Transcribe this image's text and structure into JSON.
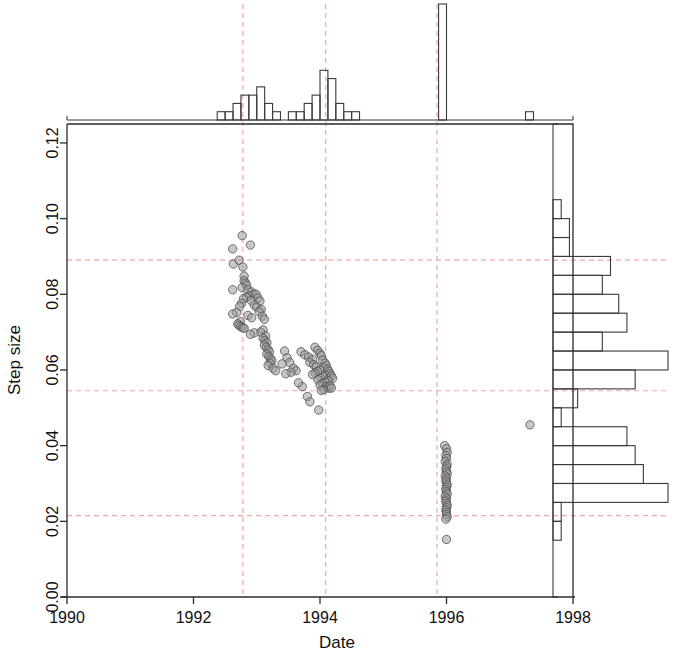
{
  "chart_data": {
    "type": "scatter",
    "title": "",
    "subtitle": "",
    "xlabel": "Date",
    "ylabel": "Step size",
    "xlim": [
      1990,
      1998
    ],
    "ylim": [
      0.0,
      0.125
    ],
    "xticks": [
      1990,
      1992,
      1994,
      1996,
      1998
    ],
    "xticklabels": [
      "1990",
      "1992",
      "1994",
      "1996",
      "1998"
    ],
    "yticks": [
      0.0,
      0.02,
      0.04,
      0.06,
      0.08,
      0.1,
      0.12
    ],
    "yticklabels": [
      "0.00",
      "0.02",
      "0.04",
      "0.06",
      "0.08",
      "0.10",
      "0.12"
    ],
    "grid": false,
    "legend": null,
    "marker": {
      "shape": "circle",
      "fill_color": "#9b9b9b",
      "fill_opacity": 0.55,
      "edge_color": "#4a4a4a",
      "radius_px": 4.2
    },
    "reference_lines": {
      "color": "#f0a0a0",
      "style": "dashed",
      "horizontal": [
        0.089,
        0.0545,
        0.0215
      ],
      "vertical": [
        1992.78,
        1994.09,
        1995.85
      ]
    },
    "points": [
      [
        1992.62,
        0.092
      ],
      [
        1992.63,
        0.088
      ],
      [
        1992.77,
        0.0955
      ],
      [
        1992.9,
        0.093
      ],
      [
        1992.72,
        0.089
      ],
      [
        1992.78,
        0.0872
      ],
      [
        1992.62,
        0.0812
      ],
      [
        1992.8,
        0.0848
      ],
      [
        1992.8,
        0.0836
      ],
      [
        1992.82,
        0.083
      ],
      [
        1992.84,
        0.0824
      ],
      [
        1992.77,
        0.0818
      ],
      [
        1992.86,
        0.0812
      ],
      [
        1992.92,
        0.0806
      ],
      [
        1992.95,
        0.08
      ],
      [
        1992.88,
        0.0796
      ],
      [
        1992.84,
        0.0792
      ],
      [
        1992.79,
        0.0788
      ],
      [
        1992.91,
        0.0784
      ],
      [
        1992.99,
        0.08
      ],
      [
        1993.02,
        0.079
      ],
      [
        1993.05,
        0.0782
      ],
      [
        1992.76,
        0.0776
      ],
      [
        1992.73,
        0.0768
      ],
      [
        1992.96,
        0.0772
      ],
      [
        1993.0,
        0.0766
      ],
      [
        1993.07,
        0.076
      ],
      [
        1993.04,
        0.0754
      ],
      [
        1992.68,
        0.0752
      ],
      [
        1992.62,
        0.0748
      ],
      [
        1992.86,
        0.0744
      ],
      [
        1992.92,
        0.0738
      ],
      [
        1993.09,
        0.0742
      ],
      [
        1993.12,
        0.0734
      ],
      [
        1992.74,
        0.0728
      ],
      [
        1992.7,
        0.0722
      ],
      [
        1992.72,
        0.0718
      ],
      [
        1992.75,
        0.0714
      ],
      [
        1992.78,
        0.0712
      ],
      [
        1992.8,
        0.071
      ],
      [
        1993.1,
        0.0706
      ],
      [
        1993.06,
        0.07
      ],
      [
        1992.96,
        0.0698
      ],
      [
        1992.9,
        0.0694
      ],
      [
        1993.14,
        0.069
      ],
      [
        1993.1,
        0.0684
      ],
      [
        1993.13,
        0.0678
      ],
      [
        1993.16,
        0.0672
      ],
      [
        1993.12,
        0.0666
      ],
      [
        1993.15,
        0.066
      ],
      [
        1993.18,
        0.0654
      ],
      [
        1993.2,
        0.0648
      ],
      [
        1993.16,
        0.0642
      ],
      [
        1993.19,
        0.0636
      ],
      [
        1993.22,
        0.063
      ],
      [
        1993.24,
        0.0624
      ],
      [
        1993.21,
        0.0618
      ],
      [
        1993.18,
        0.0612
      ],
      [
        1993.26,
        0.0604
      ],
      [
        1993.3,
        0.0598
      ],
      [
        1993.44,
        0.065
      ],
      [
        1993.48,
        0.0632
      ],
      [
        1993.52,
        0.062
      ],
      [
        1993.4,
        0.0616
      ],
      [
        1993.58,
        0.0604
      ],
      [
        1993.62,
        0.0598
      ],
      [
        1993.54,
        0.0594
      ],
      [
        1993.46,
        0.059
      ],
      [
        1993.7,
        0.0648
      ],
      [
        1993.76,
        0.064
      ],
      [
        1993.82,
        0.0634
      ],
      [
        1993.88,
        0.0628
      ],
      [
        1993.92,
        0.066
      ],
      [
        1993.96,
        0.0652
      ],
      [
        1994.0,
        0.0644
      ],
      [
        1994.02,
        0.0638
      ],
      [
        1993.84,
        0.062
      ],
      [
        1993.9,
        0.0614
      ],
      [
        1993.94,
        0.0608
      ],
      [
        1994.04,
        0.0626
      ],
      [
        1994.08,
        0.0618
      ],
      [
        1994.1,
        0.0612
      ],
      [
        1994.06,
        0.0606
      ],
      [
        1994.0,
        0.06
      ],
      [
        1993.96,
        0.0596
      ],
      [
        1993.92,
        0.0592
      ],
      [
        1993.88,
        0.0588
      ],
      [
        1994.12,
        0.0602
      ],
      [
        1994.14,
        0.0596
      ],
      [
        1994.16,
        0.059
      ],
      [
        1994.09,
        0.0586
      ],
      [
        1994.05,
        0.0582
      ],
      [
        1994.01,
        0.0578
      ],
      [
        1993.97,
        0.0574
      ],
      [
        1994.18,
        0.0584
      ],
      [
        1994.2,
        0.0578
      ],
      [
        1994.13,
        0.0572
      ],
      [
        1994.08,
        0.0568
      ],
      [
        1994.04,
        0.0564
      ],
      [
        1994.0,
        0.056
      ],
      [
        1994.1,
        0.0556
      ],
      [
        1994.14,
        0.0552
      ],
      [
        1994.06,
        0.0548
      ],
      [
        1994.02,
        0.0546
      ],
      [
        1994.16,
        0.0558
      ],
      [
        1994.18,
        0.0552
      ],
      [
        1993.8,
        0.053
      ],
      [
        1993.84,
        0.0516
      ],
      [
        1993.98,
        0.0494
      ],
      [
        1993.72,
        0.0556
      ],
      [
        1993.66,
        0.0566
      ],
      [
        1995.97,
        0.04
      ],
      [
        1996.0,
        0.0392
      ],
      [
        1996.01,
        0.0382
      ],
      [
        1995.99,
        0.0374
      ],
      [
        1996.0,
        0.0366
      ],
      [
        1995.98,
        0.0358
      ],
      [
        1996.01,
        0.035
      ],
      [
        1996.0,
        0.0344
      ],
      [
        1995.99,
        0.0338
      ],
      [
        1996.0,
        0.0332
      ],
      [
        1996.01,
        0.0326
      ],
      [
        1995.98,
        0.032
      ],
      [
        1996.0,
        0.0314
      ],
      [
        1995.99,
        0.0308
      ],
      [
        1996.0,
        0.0302
      ],
      [
        1996.01,
        0.0296
      ],
      [
        1996.0,
        0.029
      ],
      [
        1995.99,
        0.0284
      ],
      [
        1996.0,
        0.0278
      ],
      [
        1996.01,
        0.0272
      ],
      [
        1995.98,
        0.0266
      ],
      [
        1996.0,
        0.026
      ],
      [
        1995.99,
        0.0254
      ],
      [
        1996.0,
        0.0248
      ],
      [
        1996.01,
        0.0242
      ],
      [
        1996.0,
        0.0236
      ],
      [
        1995.99,
        0.023
      ],
      [
        1996.0,
        0.0224
      ],
      [
        1996.0,
        0.0218
      ],
      [
        1996.01,
        0.0212
      ],
      [
        1995.99,
        0.0206
      ],
      [
        1996.0,
        0.0152
      ],
      [
        1997.32,
        0.0455
      ]
    ],
    "top_histogram": {
      "orientation": "vertical",
      "bin_width_years": 0.125,
      "bins": [
        {
          "x0": 1992.375,
          "count": 1
        },
        {
          "x0": 1992.5,
          "count": 1
        },
        {
          "x0": 1992.625,
          "count": 2
        },
        {
          "x0": 1992.75,
          "count": 3
        },
        {
          "x0": 1992.875,
          "count": 3
        },
        {
          "x0": 1993.0,
          "count": 4
        },
        {
          "x0": 1993.125,
          "count": 2
        },
        {
          "x0": 1993.25,
          "count": 1
        },
        {
          "x0": 1993.5,
          "count": 1
        },
        {
          "x0": 1993.625,
          "count": 1
        },
        {
          "x0": 1993.75,
          "count": 2
        },
        {
          "x0": 1993.875,
          "count": 3
        },
        {
          "x0": 1994.0,
          "count": 6
        },
        {
          "x0": 1994.125,
          "count": 5
        },
        {
          "x0": 1994.25,
          "count": 2
        },
        {
          "x0": 1994.375,
          "count": 1
        },
        {
          "x0": 1994.5,
          "count": 1
        },
        {
          "x0": 1995.875,
          "count": 14
        },
        {
          "x0": 1997.25,
          "count": 1
        }
      ],
      "max_count": 14
    },
    "right_histogram": {
      "orientation": "horizontal",
      "bin_width": 0.005,
      "bins": [
        {
          "y0": 0.1,
          "count": 1
        },
        {
          "y0": 0.095,
          "count": 2
        },
        {
          "y0": 0.09,
          "count": 2
        },
        {
          "y0": 0.085,
          "count": 7
        },
        {
          "y0": 0.08,
          "count": 6
        },
        {
          "y0": 0.075,
          "count": 8
        },
        {
          "y0": 0.07,
          "count": 9
        },
        {
          "y0": 0.065,
          "count": 6
        },
        {
          "y0": 0.06,
          "count": 14
        },
        {
          "y0": 0.055,
          "count": 10
        },
        {
          "y0": 0.05,
          "count": 3
        },
        {
          "y0": 0.045,
          "count": 1
        },
        {
          "y0": 0.04,
          "count": 9
        },
        {
          "y0": 0.035,
          "count": 10
        },
        {
          "y0": 0.03,
          "count": 11
        },
        {
          "y0": 0.025,
          "count": 14
        },
        {
          "y0": 0.02,
          "count": 1
        },
        {
          "y0": 0.015,
          "count": 1
        }
      ],
      "max_count": 14
    }
  },
  "axes": {
    "x_title": "Date",
    "y_title": "Step size"
  },
  "colors": {
    "axis": "#2b2b2b",
    "reference_line": "#f1a8a4",
    "point_fill": "#9b9b9b",
    "point_edge": "#4d4d4d",
    "hist_stroke": "#3a3a3a"
  }
}
